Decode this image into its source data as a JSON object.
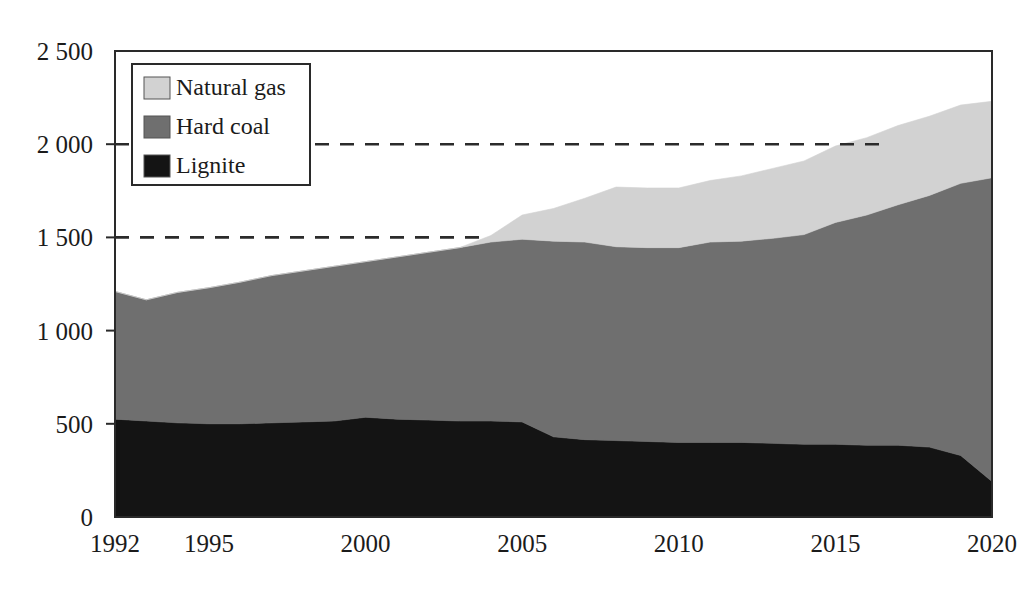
{
  "chart_data": {
    "type": "area",
    "stacked": true,
    "title": "",
    "subtitle": "",
    "xlabel": "",
    "ylabel": "",
    "xlim": [
      1992,
      2020
    ],
    "ylim": [
      0,
      2500
    ],
    "grid": false,
    "legend_position": "top-left",
    "x": [
      1992,
      1993,
      1994,
      1995,
      1996,
      1997,
      1998,
      1999,
      2000,
      2001,
      2002,
      2003,
      2004,
      2005,
      2006,
      2007,
      2008,
      2009,
      2010,
      2011,
      2012,
      2013,
      2014,
      2015,
      2016,
      2017,
      2018,
      2019,
      2020
    ],
    "series": [
      {
        "name": "Lignite",
        "color": "#141414",
        "values": [
          525,
          515,
          505,
          500,
          500,
          505,
          510,
          515,
          535,
          525,
          520,
          515,
          515,
          510,
          430,
          415,
          410,
          405,
          400,
          400,
          400,
          395,
          390,
          390,
          385,
          385,
          375,
          330,
          190
        ]
      },
      {
        "name": "Hard coal",
        "color": "#6f6f6f",
        "values": [
          685,
          650,
          700,
          730,
          760,
          790,
          810,
          830,
          835,
          870,
          900,
          930,
          960,
          980,
          1050,
          1060,
          1040,
          1040,
          1045,
          1075,
          1080,
          1100,
          1125,
          1190,
          1235,
          1290,
          1350,
          1460,
          1630
        ]
      },
      {
        "name": "Natural gas",
        "color": "#d2d2d2",
        "values": [
          0,
          0,
          0,
          0,
          0,
          0,
          0,
          0,
          0,
          0,
          0,
          0,
          35,
          130,
          175,
          235,
          320,
          320,
          320,
          330,
          350,
          375,
          395,
          410,
          415,
          425,
          425,
          420,
          410
        ]
      }
    ],
    "totals": [
      1210,
      1165,
      1205,
      1230,
      1260,
      1295,
      1320,
      1345,
      1370,
      1395,
      1420,
      1445,
      1510,
      1620,
      1655,
      1710,
      1770,
      1765,
      1765,
      1805,
      1830,
      1870,
      1910,
      1990,
      2035,
      2100,
      2150,
      2210,
      2230
    ],
    "y_ticks": [
      {
        "value": 0,
        "label": "0"
      },
      {
        "value": 500,
        "label": "500"
      },
      {
        "value": 1000,
        "label": "1 000"
      },
      {
        "value": 1500,
        "label": "1 500"
      },
      {
        "value": 2000,
        "label": "2 000"
      },
      {
        "value": 2500,
        "label": "2 500"
      }
    ],
    "x_ticks": [
      {
        "value": 1992,
        "label": "1992"
      },
      {
        "value": 1995,
        "label": "1995"
      },
      {
        "value": 2000,
        "label": "2000"
      },
      {
        "value": 2005,
        "label": "2005"
      },
      {
        "value": 2010,
        "label": "2010"
      },
      {
        "value": 2015,
        "label": "2015"
      },
      {
        "value": 2020,
        "label": "2020"
      }
    ],
    "reference_lines": [
      {
        "value": 2000,
        "style": "dashed",
        "x_start": 1992,
        "x_end": 2016.6
      },
      {
        "value": 1500,
        "style": "dashed",
        "x_start": 1992,
        "x_end": 2003.7
      }
    ],
    "legend": {
      "items": [
        {
          "label": "Natural gas",
          "color": "#d2d2d2"
        },
        {
          "label": "Hard coal",
          "color": "#6f6f6f"
        },
        {
          "label": "Lignite",
          "color": "#141414"
        }
      ]
    }
  },
  "colors": {
    "natural_gas": "#d2d2d2",
    "hard_coal": "#6f6f6f",
    "lignite": "#141414",
    "axis": "#2a2a2a",
    "background": "#ffffff"
  }
}
